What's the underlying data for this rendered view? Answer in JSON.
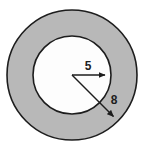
{
  "figure": {
    "type": "annulus-diagram",
    "background_color": "#ffffff",
    "canvas": {
      "width": 150,
      "height": 149
    },
    "center": {
      "x": 72,
      "y": 75
    },
    "outer_circle": {
      "name": "outer-circle",
      "radius": 65,
      "fill_color": "#b8b8b8",
      "stroke_color": "#1d1d1d",
      "stroke_width": 1.6
    },
    "inner_circle": {
      "name": "inner-circle",
      "radius": 39,
      "fill_color": "#fdfdfd",
      "stroke_color": "#1d1d1d",
      "stroke_width": 1.6
    },
    "dimensions": [
      {
        "id": "inner-radius",
        "label": "5",
        "value": 5,
        "direction": "horizontal-right",
        "angle_degrees": 0,
        "from": {
          "x": 72,
          "y": 75
        },
        "to": {
          "x": 111,
          "y": 75
        },
        "label_position": {
          "x": 88,
          "y": 69
        },
        "arrow_color": "#1d1d1d"
      },
      {
        "id": "outer-radius",
        "label": "8",
        "value": 8,
        "direction": "diagonal-down-right",
        "angle_degrees": 45,
        "from": {
          "x": 72,
          "y": 75
        },
        "to": {
          "x": 118,
          "y": 121
        },
        "label_position": {
          "x": 113,
          "y": 101
        },
        "arrow_color": "#1d1d1d"
      }
    ]
  }
}
